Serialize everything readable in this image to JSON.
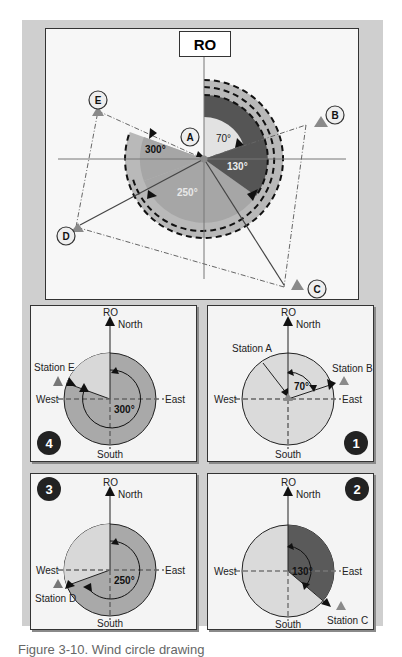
{
  "figure": {
    "caption": "Figure 3-10. Wind circle drawing"
  },
  "main_diagram": {
    "title": "RO",
    "center_station": "A",
    "stations": [
      {
        "id": "A",
        "label": "A"
      },
      {
        "id": "B",
        "label": "B"
      },
      {
        "id": "C",
        "label": "C"
      },
      {
        "id": "D",
        "label": "D"
      },
      {
        "id": "E",
        "label": "E"
      }
    ],
    "angles": [
      {
        "station": "B",
        "value": "70°"
      },
      {
        "station": "C",
        "value": "130°"
      },
      {
        "station": "D",
        "value": "250°"
      },
      {
        "station": "E",
        "value": "300°"
      }
    ],
    "colors": {
      "light_sector": "#dcdcdc",
      "dark_sector": "#555555",
      "mid_sector": "#a9a9a9",
      "ring": "#b9b9b9",
      "station_marker": "#8a8a8a"
    }
  },
  "panels": [
    {
      "number": "4",
      "ro_label": "RO",
      "north_label": "North",
      "south_label": "South",
      "east_label": "East",
      "west_label": "West",
      "station_label": "Station E",
      "angle_label": "300°"
    },
    {
      "number": "1",
      "ro_label": "RO",
      "north_label": "North",
      "south_label": "South",
      "east_label": "East",
      "west_label": "West",
      "station_label": "Station B",
      "center_label": "Station A",
      "angle_label": "70°"
    },
    {
      "number": "3",
      "ro_label": "RO",
      "north_label": "North",
      "south_label": "South",
      "east_label": "East",
      "west_label": "West",
      "station_label": "Station D",
      "angle_label": "250°"
    },
    {
      "number": "2",
      "ro_label": "RO",
      "north_label": "North",
      "south_label": "South",
      "east_label": "East",
      "west_label": "West",
      "station_label": "Station C",
      "angle_label": "130°"
    }
  ]
}
